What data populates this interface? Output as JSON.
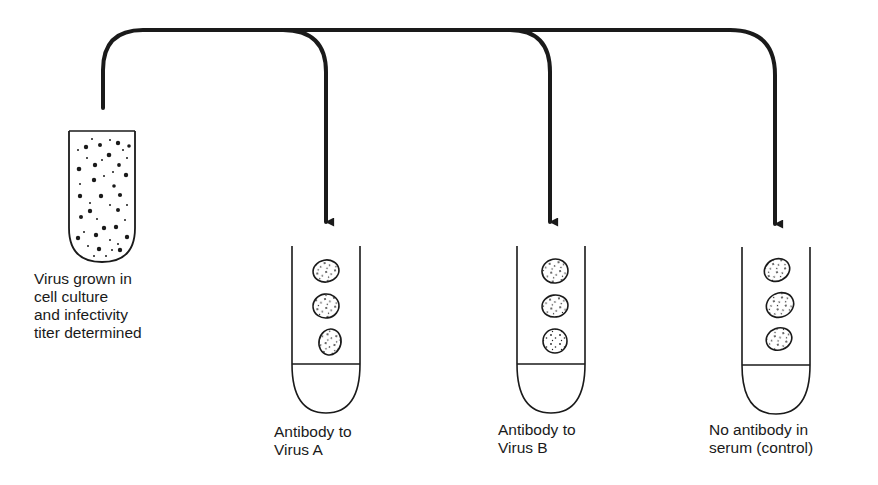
{
  "diagram": {
    "type": "virus-neutralization-assay",
    "source": {
      "label_lines": [
        "Virus grown in",
        "cell culture",
        "and infectivity",
        "titer determined"
      ],
      "icon": "test-tube-with-virus-particles"
    },
    "targets": [
      {
        "id": "virus-a",
        "label_lines": [
          "Antibody to",
          "Virus A"
        ],
        "icon": "test-tube-with-cells",
        "cell_count": 3
      },
      {
        "id": "virus-b",
        "label_lines": [
          "Antibody to",
          "Virus B"
        ],
        "icon": "test-tube-with-cells",
        "cell_count": 3
      },
      {
        "id": "control",
        "label_lines": [
          "No antibody in",
          "serum (control)"
        ],
        "icon": "test-tube-with-cells",
        "cell_count": 3
      }
    ],
    "connector": "branching-arrow",
    "colors": {
      "line": "#1a1a1a",
      "background": "#ffffff"
    }
  }
}
